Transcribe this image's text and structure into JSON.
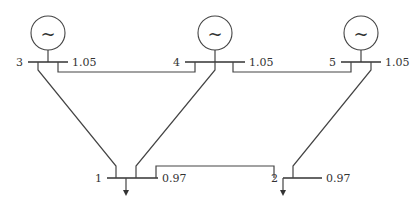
{
  "diagram": {
    "type": "power-system-one-line",
    "buses": [
      {
        "id": "3",
        "label": "3",
        "voltage": "1.05",
        "generator": true
      },
      {
        "id": "4",
        "label": "4",
        "voltage": "1.05",
        "generator": true
      },
      {
        "id": "5",
        "label": "5",
        "voltage": "1.05",
        "generator": true
      },
      {
        "id": "1",
        "label": "1",
        "voltage": "0.97",
        "load": true
      },
      {
        "id": "2",
        "label": "2",
        "voltage": "0.97",
        "load": true
      }
    ],
    "generator_symbol": "~",
    "lines": [
      {
        "from": "3",
        "to": "4"
      },
      {
        "from": "4",
        "to": "5"
      },
      {
        "from": "3",
        "to": "1"
      },
      {
        "from": "4",
        "to": "1"
      },
      {
        "from": "5",
        "to": "2"
      },
      {
        "from": "1",
        "to": "2"
      }
    ]
  }
}
